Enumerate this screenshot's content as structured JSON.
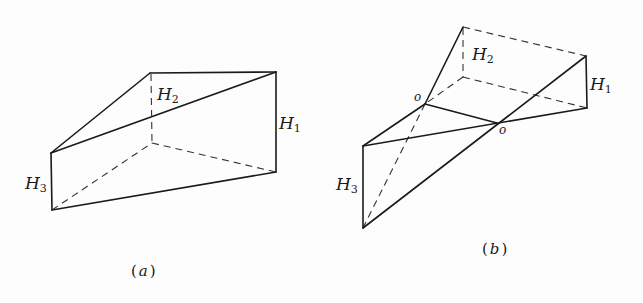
{
  "figure_a": {
    "caption_open": "(",
    "caption_letter": "a",
    "caption_close": ")",
    "labels": {
      "h1": {
        "main": "H",
        "sub": "1"
      },
      "h2": {
        "main": "H",
        "sub": "2"
      },
      "h3": {
        "main": "H",
        "sub": "3"
      }
    }
  },
  "figure_b": {
    "caption_open": "(",
    "caption_letter": "b",
    "caption_close": ")",
    "labels": {
      "h1": {
        "main": "H",
        "sub": "1"
      },
      "h2": {
        "main": "H",
        "sub": "2"
      },
      "h3": {
        "main": "H",
        "sub": "3"
      },
      "o_left": "o",
      "o_right": "o"
    }
  },
  "colors": {
    "line": "#1a1a1a",
    "background": "#fdfdfd"
  }
}
